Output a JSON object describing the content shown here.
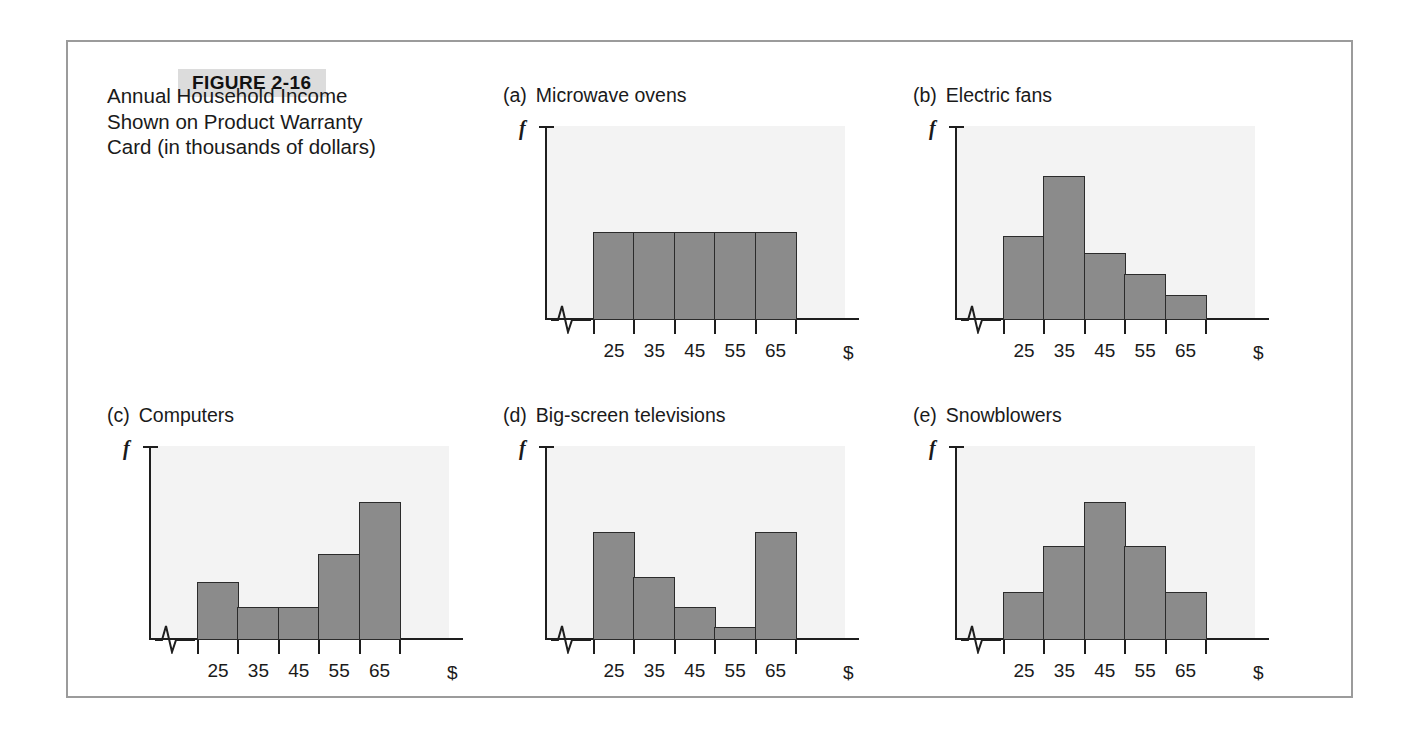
{
  "figure": {
    "tag": "FIGURE 2-16",
    "caption": "Annual Household Income\nShown on Product Warranty\nCard (in thousands of dollars)"
  },
  "axis": {
    "y_label": "f",
    "x_unit": "$",
    "tick_labels": [
      "25",
      "35",
      "45",
      "55",
      "65"
    ]
  },
  "colors": {
    "bar_fill": "#8b8b8b",
    "bar_border": "#2b2b2b",
    "axis": "#1e1e1e",
    "panel_bg": "#f3f3f3",
    "frame_border": "#9b9b9b",
    "tag_bg": "#dcdcdc"
  },
  "panels": [
    {
      "tag": "(a)",
      "title": "Microwave ovens"
    },
    {
      "tag": "(b)",
      "title": "Electric fans"
    },
    {
      "tag": "(c)",
      "title": "Computers"
    },
    {
      "tag": "(d)",
      "title": "Big-screen televisions"
    },
    {
      "tag": "(e)",
      "title": "Snowblowers"
    }
  ],
  "chart_data": [
    {
      "type": "bar",
      "title": "Microwave ovens",
      "panel": "(a)",
      "shape": "uniform",
      "categories": [
        "25",
        "35",
        "45",
        "55",
        "65"
      ],
      "values": [
        0.46,
        0.46,
        0.46,
        0.46,
        0.46
      ],
      "xlabel": "$",
      "ylabel": "f",
      "ylim": [
        0,
        1
      ],
      "grid": false,
      "axis_break": true
    },
    {
      "type": "bar",
      "title": "Electric fans",
      "panel": "(b)",
      "shape": "skewed-right",
      "categories": [
        "25",
        "35",
        "45",
        "55",
        "65"
      ],
      "values": [
        0.44,
        0.75,
        0.35,
        0.24,
        0.13
      ],
      "xlabel": "$",
      "ylabel": "f",
      "ylim": [
        0,
        1
      ],
      "grid": false,
      "axis_break": true
    },
    {
      "type": "bar",
      "title": "Computers",
      "panel": "(c)",
      "shape": "skewed-left",
      "categories": [
        "25",
        "35",
        "45",
        "55",
        "65"
      ],
      "values": [
        0.3,
        0.17,
        0.17,
        0.45,
        0.72
      ],
      "xlabel": "$",
      "ylabel": "f",
      "ylim": [
        0,
        1
      ],
      "grid": false,
      "axis_break": true
    },
    {
      "type": "bar",
      "title": "Big-screen televisions",
      "panel": "(d)",
      "shape": "bimodal-u-shaped",
      "categories": [
        "25",
        "35",
        "45",
        "55",
        "65"
      ],
      "values": [
        0.56,
        0.33,
        0.17,
        0.07,
        0.56
      ],
      "xlabel": "$",
      "ylabel": "f",
      "ylim": [
        0,
        1
      ],
      "grid": false,
      "axis_break": true
    },
    {
      "type": "bar",
      "title": "Snowblowers",
      "panel": "(e)",
      "shape": "symmetric-bell",
      "categories": [
        "25",
        "35",
        "45",
        "55",
        "65"
      ],
      "values": [
        0.25,
        0.49,
        0.72,
        0.49,
        0.25
      ],
      "xlabel": "$",
      "ylabel": "f",
      "ylim": [
        0,
        1
      ],
      "grid": false,
      "axis_break": true
    }
  ]
}
